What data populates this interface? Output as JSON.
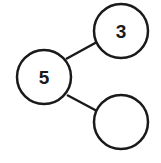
{
  "diagram": {
    "type": "number-bond",
    "whole": {
      "value": "5"
    },
    "parts": [
      {
        "value": "3"
      },
      {
        "value": ""
      }
    ],
    "colors": {
      "stroke": "#1a1a1a",
      "background": "#ffffff"
    }
  }
}
